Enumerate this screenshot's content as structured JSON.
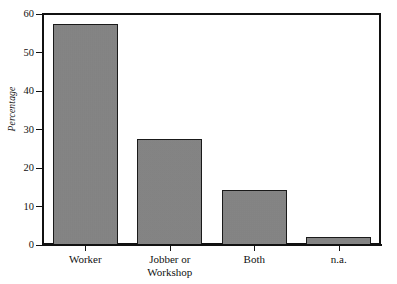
{
  "chart_data": {
    "type": "bar",
    "title": "",
    "subtitle": "",
    "xlabel": "",
    "ylabel": "Percentage",
    "categories": [
      "Worker",
      "Jobber or\nWorkshop",
      "Both",
      "n.a."
    ],
    "values": [
      57.5,
      27.5,
      14.3,
      2.0
    ],
    "ylim": [
      0,
      60
    ],
    "yticks": [
      0,
      10,
      20,
      30,
      40,
      50,
      60
    ],
    "ytick_labels": [
      "0",
      "10",
      "20",
      "30",
      "40",
      "50",
      "60"
    ],
    "grid": false,
    "legend": null,
    "bar_color": "#848484",
    "bar_edge_color": "#1a1a1a",
    "axis_color": "#111111",
    "background_color": "#ffffff"
  }
}
